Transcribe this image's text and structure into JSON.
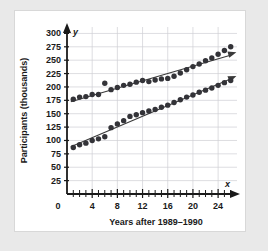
{
  "chart_data": {
    "type": "scatter",
    "title": "",
    "xlabel": "Years after 1989–1990",
    "ylabel": "Participants (thousands)",
    "x_axis_symbol": "x",
    "y_axis_symbol": "y",
    "xlim": [
      0,
      27
    ],
    "ylim": [
      0,
      312
    ],
    "xticks": [
      0,
      4,
      8,
      12,
      16,
      20,
      24
    ],
    "xtick_labels": [
      "0",
      "4",
      "8",
      "12",
      "16",
      "20",
      "24"
    ],
    "x_minor_tick_step": 1,
    "yticks": [
      25,
      50,
      75,
      100,
      125,
      150,
      175,
      200,
      225,
      250,
      275,
      300
    ],
    "ytick_labels": [
      "25",
      "50",
      "75",
      "100",
      "125",
      "150",
      "175",
      "200",
      "225",
      "250",
      "275",
      "300"
    ],
    "grid": true,
    "grid_color": "#cfcfd4",
    "marker_color": "#333338",
    "trendline_color": "#3a3a3a",
    "legend": "none",
    "series": [
      {
        "name": "upper-series",
        "marker": "filled-circle",
        "trendline": "increasing-with-arrow",
        "x": [
          1,
          2,
          3,
          4,
          5,
          6,
          7,
          8,
          9,
          10,
          11,
          12,
          13,
          14,
          15,
          16,
          17,
          18,
          19,
          20,
          21,
          22,
          23,
          24,
          25,
          26
        ],
        "values": [
          177,
          181,
          182,
          186,
          186,
          207,
          195,
          199,
          203,
          205,
          209,
          212,
          210,
          213,
          215,
          216,
          220,
          226,
          232,
          238,
          243,
          249,
          254,
          261,
          268,
          275
        ]
      },
      {
        "name": "lower-series",
        "marker": "filled-circle",
        "trendline": "increasing-with-arrow",
        "x": [
          1,
          2,
          3,
          4,
          5,
          6,
          7,
          8,
          9,
          10,
          11,
          12,
          13,
          14,
          15,
          16,
          17,
          18,
          19,
          20,
          21,
          22,
          23,
          24,
          25,
          26
        ],
        "values": [
          87,
          92,
          95,
          100,
          103,
          107,
          124,
          131,
          137,
          145,
          148,
          152,
          155,
          158,
          162,
          166,
          171,
          176,
          181,
          185,
          190,
          194,
          198,
          203,
          208,
          212
        ]
      }
    ]
  }
}
